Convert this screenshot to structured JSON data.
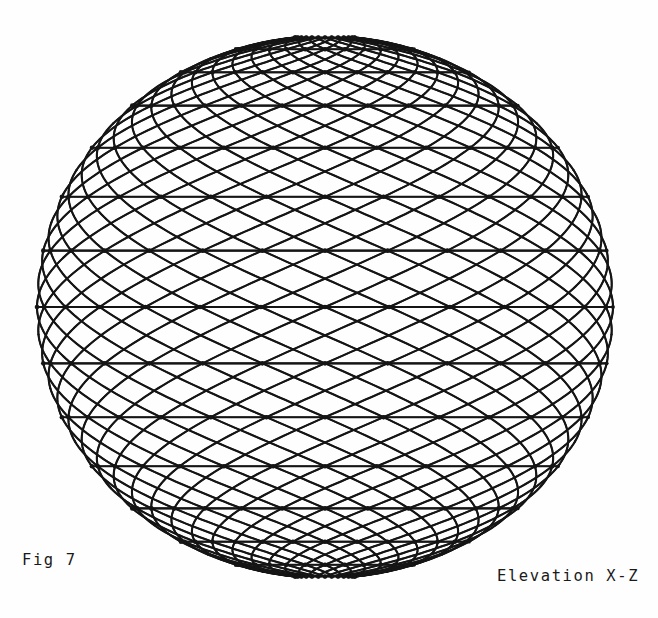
{
  "page": {
    "width": 658,
    "height": 618,
    "background_color": "#fefefe",
    "ink_color": "#151515"
  },
  "figure": {
    "name": "wireframe-sphere",
    "fig_label": "Fig 7",
    "view_label": "Elevation X-Z",
    "projection": "orthographic"
  },
  "chart_data": {
    "type": "scatter",
    "title": "Fig 7",
    "subtitle": "Elevation X-Z",
    "xlabel": "X",
    "ylabel": "Z",
    "grid": false,
    "legend": null,
    "projection": "orthographic elevation onto X-Z plane",
    "geometry": {
      "shape": "sphere",
      "center_px": [
        325,
        307
      ],
      "radius_x_px": 288,
      "radius_y_px": 271,
      "bounds_px": {
        "left": 37,
        "right": 613,
        "top": 36,
        "bottom": 578
      }
    },
    "mesh": {
      "latitude_rings": 15,
      "longitude_divisions": 28,
      "helix_families": 2,
      "helix_turn_offset_divisions": 2,
      "node_dots": true,
      "line_width_px": 2.1,
      "cell_motif": "six-pointed star / hexagon"
    },
    "latitude_degrees": [
      -84,
      -72,
      -60,
      -48,
      -36,
      -24,
      -12,
      0,
      12,
      24,
      36,
      48,
      60,
      72,
      84
    ],
    "longitude_degrees": [
      0,
      12.857,
      25.714,
      38.571,
      51.429,
      64.286,
      77.143,
      90,
      102.857,
      115.714,
      128.571,
      141.429,
      154.286,
      167.143,
      180,
      192.857,
      205.714,
      218.571,
      231.429,
      244.286,
      257.143,
      270,
      282.857,
      295.714,
      308.571,
      321.429,
      334.286,
      347.143
    ]
  }
}
